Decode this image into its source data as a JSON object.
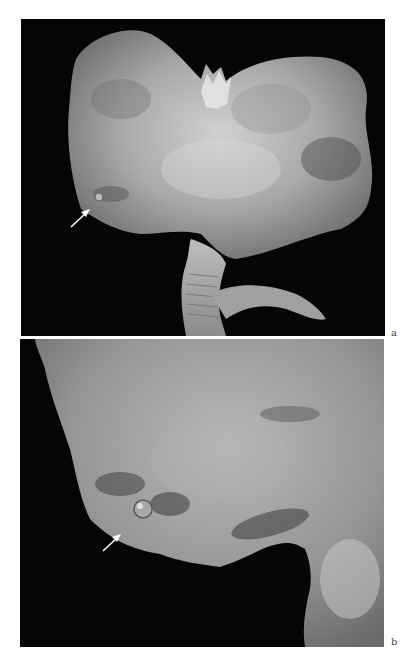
{
  "figure": {
    "panels": [
      {
        "id": "a",
        "label": "a",
        "description": "Gross specimen photograph on black background, opened organ with two lobes; arrow pointing to small nodular lesion at left lower margin"
      },
      {
        "id": "b",
        "label": "b",
        "description": "Close-up of left lower region of specimen; arrow pointing to small round cystic/polypoid lesion near margin"
      }
    ],
    "colors": {
      "background": "#ffffff",
      "panel_background": "#050505",
      "tissue_light": "#c8c8c8",
      "tissue_mid": "#9a9a9a",
      "tissue_dark": "#5a5a5a",
      "arrow": "#ffffff"
    }
  }
}
